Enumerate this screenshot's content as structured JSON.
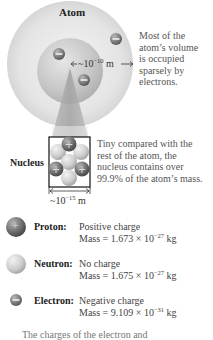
{
  "diagram": {
    "atom_label": "Atom",
    "atom_size_base": "~10",
    "atom_size_exp": "−10",
    "atom_size_unit": "m",
    "atom_note": [
      "Most of the",
      "atom’s volume",
      "is occupied",
      "sparsely by",
      "electrons."
    ],
    "nucleus_label": "Nucleus",
    "nucleus_note": [
      "Tiny compared with the",
      "rest of the atom, the",
      "nucleus contains over",
      "99.9% of the atom’s mass."
    ],
    "nucleus_size_base": "~10",
    "nucleus_size_exp": "−15",
    "nucleus_size_unit": "m"
  },
  "legend": [
    {
      "name": "Proton:",
      "charge": "Positive charge",
      "mass_prefix": "Mass = 1.673 × 10",
      "mass_exp": "−27",
      "mass_unit": " kg",
      "icon": "proton-plus-sphere"
    },
    {
      "name": "Neutron:",
      "charge": "No charge",
      "mass_prefix": "Mass = 1.675 × 10",
      "mass_exp": "−27",
      "mass_unit": " kg",
      "icon": "neutron-sphere"
    },
    {
      "name": "Electron:",
      "charge": "Negative charge",
      "mass_prefix": "Mass = 9.109 × 10",
      "mass_exp": "−31",
      "mass_unit": " kg",
      "icon": "electron-minus-sphere"
    }
  ],
  "footer": "The charges of the electron and",
  "colors": {
    "outer_cloud": "#e2e2e2",
    "inner_sphere": "#c8c8c8",
    "cone": "#a8a8a8",
    "proton": "#7a7a7a",
    "neutron": "#d0d0d0",
    "electron": "#8a8a8a"
  }
}
